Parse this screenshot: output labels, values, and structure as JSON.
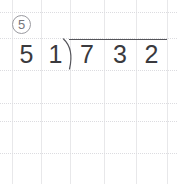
{
  "worksheet": {
    "problem_number": "5",
    "problem_number_style": "circled",
    "background_color": "#ffffff",
    "grid": {
      "line_color": "#e8e8ea",
      "dotted_line_color": "#dcdce0",
      "vertical_lines_x": [
        12,
        41,
        70,
        104,
        136,
        167
      ],
      "horizontal_lines_y": [
        12,
        38,
        70,
        103,
        121,
        153
      ]
    },
    "division": {
      "ink_color": "#3a3a3e",
      "bar_color": "#55555a",
      "divisor": "51",
      "divisor_digits": [
        "5",
        "1"
      ],
      "dividend": "732",
      "dividend_digits": [
        "7",
        "3",
        "2"
      ],
      "quotient": "",
      "expression": "732 ÷ 51",
      "bracket_icon": "long-division-bracket"
    }
  }
}
